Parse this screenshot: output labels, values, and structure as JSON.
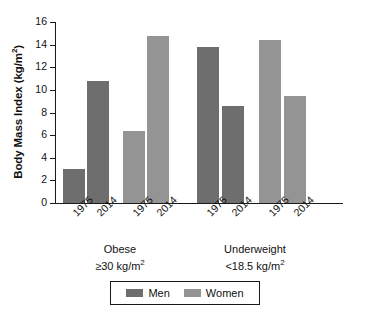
{
  "chart_data": {
    "type": "bar",
    "title": "",
    "xlabel": "",
    "ylabel": "Body Mass Index (kg/m2)",
    "ylabel_base": "Body Mass Index (kg/m",
    "ylabel_sup": "2",
    "ylabel_tail": ")",
    "ylim": [
      0,
      16
    ],
    "ytick_step": 2,
    "yticks": [
      "16",
      "14",
      "12",
      "10",
      "8",
      "6",
      "4",
      "2",
      "0"
    ],
    "ytick_values": [
      16,
      14,
      12,
      10,
      8,
      6,
      4,
      2,
      0
    ],
    "grid": false,
    "legend_position": "bottom-center",
    "categories": [
      "1975",
      "2014",
      "1975",
      "2014",
      "1975",
      "2014",
      "1975",
      "2014"
    ],
    "groups": [
      {
        "name": "Obese",
        "criterion_prefix": "≥30 kg/m",
        "criterion_sup": "2",
        "criterion": "≥30 kg/m2"
      },
      {
        "name": "Underweight",
        "criterion_prefix": "<18.5 kg/m",
        "criterion_sup": "2",
        "criterion": "<18.5 kg/m2"
      }
    ],
    "series": [
      {
        "name": "Men",
        "color": "#6e6e6e",
        "points": [
          {
            "group": "Obese",
            "year": "1975",
            "value": 3.0
          },
          {
            "group": "Obese",
            "year": "2014",
            "value": 10.8
          },
          {
            "group": "Underweight",
            "year": "1975",
            "value": 13.8
          },
          {
            "group": "Underweight",
            "year": "2014",
            "value": 8.6
          }
        ]
      },
      {
        "name": "Women",
        "color": "#949494",
        "points": [
          {
            "group": "Obese",
            "year": "1975",
            "value": 6.4
          },
          {
            "group": "Obese",
            "year": "2014",
            "value": 14.8
          },
          {
            "group": "Underweight",
            "year": "1975",
            "value": 14.4
          },
          {
            "group": "Underweight",
            "year": "2014",
            "value": 9.5
          }
        ]
      }
    ],
    "bars": [
      {
        "label": "1975",
        "group": "Obese",
        "series": "Men",
        "value": 3.0,
        "color": "#6e6e6e"
      },
      {
        "label": "2014",
        "group": "Obese",
        "series": "Men",
        "value": 10.8,
        "color": "#6e6e6e"
      },
      {
        "label": "1975",
        "group": "Obese",
        "series": "Women",
        "value": 6.4,
        "color": "#949494"
      },
      {
        "label": "2014",
        "group": "Obese",
        "series": "Women",
        "value": 14.8,
        "color": "#949494"
      },
      {
        "label": "1975",
        "group": "Underweight",
        "series": "Men",
        "value": 13.8,
        "color": "#6e6e6e"
      },
      {
        "label": "2014",
        "group": "Underweight",
        "series": "Men",
        "value": 8.6,
        "color": "#6e6e6e"
      },
      {
        "label": "1975",
        "group": "Underweight",
        "series": "Women",
        "value": 14.4,
        "color": "#949494"
      },
      {
        "label": "2014",
        "group": "Underweight",
        "series": "Women",
        "value": 9.5,
        "color": "#949494"
      }
    ],
    "legend": [
      {
        "label": "Men",
        "color": "#6e6e6e"
      },
      {
        "label": "Women",
        "color": "#949494"
      }
    ]
  }
}
